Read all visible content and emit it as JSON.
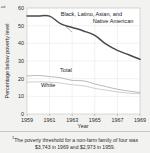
{
  "chart_data": {
    "type": "line",
    "title": "",
    "xlabel": "Year",
    "ylabel": "Percentage below poverty level",
    "ylabel_footnote_marker": "1",
    "xlim": [
      1959,
      1969
    ],
    "ylim": [
      0,
      60
    ],
    "yticks": [
      0,
      10,
      20,
      30,
      40,
      50,
      60
    ],
    "xticks": [
      1959,
      1961,
      1963,
      1965,
      1967,
      1969
    ],
    "grid": true,
    "legend_position": "inline-annotations",
    "x": [
      1959,
      1960,
      1961,
      1962,
      1963,
      1964,
      1965,
      1966,
      1967,
      1968,
      1969
    ],
    "series": [
      {
        "name": "Black, Latino, Asian, and Native American",
        "color": "#4a4a4a",
        "values": [
          55.5,
          55.5,
          55.4,
          51.0,
          49.0,
          47.0,
          44.5,
          39.5,
          36.0,
          33.5,
          31.0
        ]
      },
      {
        "name": "Total",
        "color": "#a8a8a8",
        "values": [
          21.5,
          21.8,
          21.2,
          20.5,
          19.0,
          18.8,
          17.0,
          15.5,
          14.0,
          13.0,
          12.2
        ]
      },
      {
        "name": "White",
        "color": "#c2c2c2",
        "values": [
          18.0,
          18.2,
          18.0,
          17.5,
          16.5,
          16.0,
          14.5,
          13.5,
          12.5,
          11.8,
          11.5
        ]
      }
    ],
    "annotations": [
      {
        "text_line1": "Black, Latino, Asian, and",
        "text_line2": "Native American",
        "for_series": "Black, Latino, Asian, and Native American"
      },
      {
        "text": "Total",
        "for_series": "Total"
      },
      {
        "text": "White",
        "for_series": "White"
      }
    ]
  },
  "footnote": {
    "marker": "1",
    "text": "The poverty threshold for a non-farm family of four was $3,743 in 1969 and $2,973 in 1959."
  }
}
